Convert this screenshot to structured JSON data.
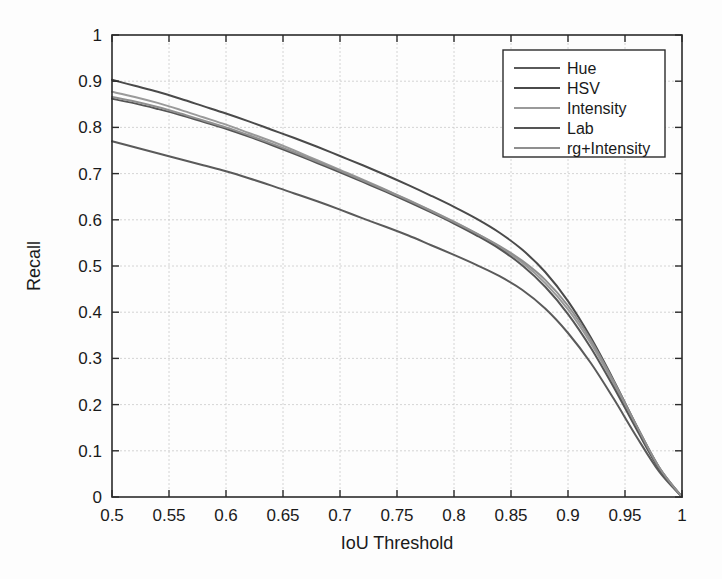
{
  "chart_data": {
    "type": "line",
    "title": "",
    "xlabel": "IoU Threshold",
    "ylabel": "Recall",
    "xlim": [
      0.5,
      1.0
    ],
    "ylim": [
      0.0,
      1.0
    ],
    "grid": true,
    "legend_position": "top-right",
    "x_ticks": [
      "0.5",
      "0.55",
      "0.6",
      "0.65",
      "0.7",
      "0.75",
      "0.8",
      "0.85",
      "0.9",
      "0.95",
      "1"
    ],
    "x_tick_values": [
      0.5,
      0.55,
      0.6,
      0.65,
      0.7,
      0.75,
      0.8,
      0.85,
      0.9,
      0.95,
      1.0
    ],
    "y_ticks": [
      "0",
      "0.1",
      "0.2",
      "0.3",
      "0.4",
      "0.5",
      "0.6",
      "0.7",
      "0.8",
      "0.9",
      "1"
    ],
    "y_tick_values": [
      0,
      0.1,
      0.2,
      0.3,
      0.4,
      0.5,
      0.6,
      0.7,
      0.8,
      0.9,
      1.0
    ],
    "x": [
      0.5,
      0.52,
      0.54,
      0.56,
      0.58,
      0.6,
      0.62,
      0.64,
      0.66,
      0.68,
      0.7,
      0.72,
      0.74,
      0.76,
      0.78,
      0.8,
      0.82,
      0.84,
      0.86,
      0.88,
      0.9,
      0.92,
      0.94,
      0.96,
      0.98,
      1.0
    ],
    "series": [
      {
        "name": "Hue",
        "color": "#5a5a5a",
        "values": [
          0.77,
          0.757,
          0.744,
          0.731,
          0.718,
          0.705,
          0.69,
          0.674,
          0.657,
          0.64,
          0.622,
          0.603,
          0.585,
          0.566,
          0.545,
          0.524,
          0.502,
          0.478,
          0.448,
          0.408,
          0.355,
          0.29,
          0.213,
          0.131,
          0.055,
          0.0
        ]
      },
      {
        "name": "HSV",
        "color": "#4a4a4a",
        "values": [
          0.903,
          0.89,
          0.877,
          0.862,
          0.846,
          0.83,
          0.813,
          0.795,
          0.777,
          0.758,
          0.738,
          0.718,
          0.697,
          0.675,
          0.652,
          0.628,
          0.602,
          0.572,
          0.535,
          0.487,
          0.424,
          0.345,
          0.253,
          0.155,
          0.064,
          0.0
        ]
      },
      {
        "name": "Intensity",
        "color": "#9a9a9a",
        "values": [
          0.877,
          0.866,
          0.853,
          0.838,
          0.822,
          0.806,
          0.788,
          0.77,
          0.75,
          0.729,
          0.708,
          0.687,
          0.665,
          0.643,
          0.62,
          0.596,
          0.57,
          0.541,
          0.507,
          0.463,
          0.406,
          0.333,
          0.246,
          0.152,
          0.063,
          0.0
        ]
      },
      {
        "name": "Lab",
        "color": "#555555",
        "values": [
          0.862,
          0.852,
          0.84,
          0.827,
          0.812,
          0.797,
          0.78,
          0.762,
          0.743,
          0.723,
          0.703,
          0.682,
          0.661,
          0.639,
          0.616,
          0.592,
          0.566,
          0.537,
          0.501,
          0.455,
          0.396,
          0.323,
          0.238,
          0.147,
          0.061,
          0.0
        ]
      },
      {
        "name": "rg+Intensity",
        "color": "#8f8f8f",
        "values": [
          0.866,
          0.856,
          0.844,
          0.83,
          0.815,
          0.8,
          0.783,
          0.765,
          0.746,
          0.726,
          0.706,
          0.685,
          0.664,
          0.642,
          0.619,
          0.595,
          0.57,
          0.543,
          0.511,
          0.47,
          0.414,
          0.34,
          0.251,
          0.155,
          0.064,
          0.0
        ]
      }
    ]
  },
  "legend": {
    "entries": [
      {
        "label": "Hue"
      },
      {
        "label": "HSV"
      },
      {
        "label": "Intensity"
      },
      {
        "label": "Lab"
      },
      {
        "label": "rg+Intensity"
      }
    ]
  },
  "axes": {
    "x_title": "IoU Threshold",
    "y_title": "Recall"
  }
}
